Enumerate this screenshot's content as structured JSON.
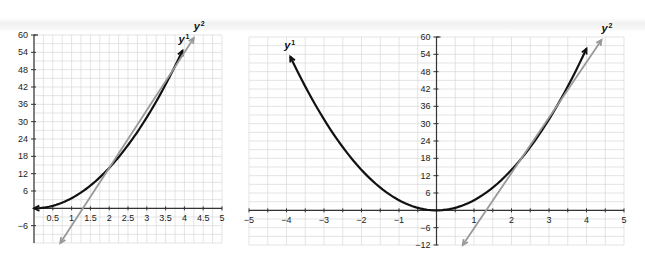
{
  "chart_data": [
    {
      "type": "line",
      "title": "",
      "xlabel": "",
      "ylabel": "",
      "xlim": [
        0,
        5
      ],
      "ylim": [
        -12,
        60
      ],
      "grid": true,
      "x_ticks": [
        "0.5",
        "1",
        "1.5",
        "2",
        "2.5",
        "3",
        "3.5",
        "4",
        "4.5",
        "5"
      ],
      "y_ticks": [
        "60",
        "54",
        "48",
        "42",
        "36",
        "30",
        "24",
        "18",
        "12",
        "6",
        "-6"
      ],
      "series": [
        {
          "name": "y1",
          "label": "y",
          "sup": "1",
          "color": "#111111",
          "kind": "parabola",
          "x": [
            0,
            0.5,
            1,
            1.5,
            2,
            2.5,
            3,
            3.5,
            3.95
          ],
          "y": [
            0,
            0.9,
            3.5,
            7.9,
            14,
            21.9,
            31.5,
            42.9,
            56
          ]
        },
        {
          "name": "y2",
          "label": "y",
          "sup": "2",
          "color": "#999999",
          "kind": "line",
          "x": [
            0.7,
            4.25
          ],
          "y": [
            -12,
            59
          ]
        }
      ]
    },
    {
      "type": "line",
      "title": "",
      "xlabel": "",
      "ylabel": "",
      "xlim": [
        -5,
        5
      ],
      "ylim": [
        -12,
        60
      ],
      "grid": true,
      "x_ticks": [
        "-5",
        "-4",
        "-3",
        "-2",
        "-1",
        "1",
        "2",
        "3",
        "4",
        "5"
      ],
      "y_ticks": [
        "60",
        "54",
        "48",
        "42",
        "36",
        "30",
        "24",
        "18",
        "12",
        "6",
        "-6",
        "-12"
      ],
      "series": [
        {
          "name": "y1",
          "label": "y",
          "sup": "1",
          "color": "#111111",
          "kind": "parabola",
          "x": [
            -3.9,
            -3,
            -2,
            -1,
            0,
            1,
            2,
            3,
            4
          ],
          "y": [
            58,
            31.5,
            14,
            3.5,
            0,
            3.5,
            14,
            31.5,
            56
          ]
        },
        {
          "name": "y2",
          "label": "y",
          "sup": "2",
          "color": "#999999",
          "kind": "line",
          "x": [
            0.7,
            4.4
          ],
          "y": [
            -12,
            59
          ]
        }
      ]
    }
  ]
}
